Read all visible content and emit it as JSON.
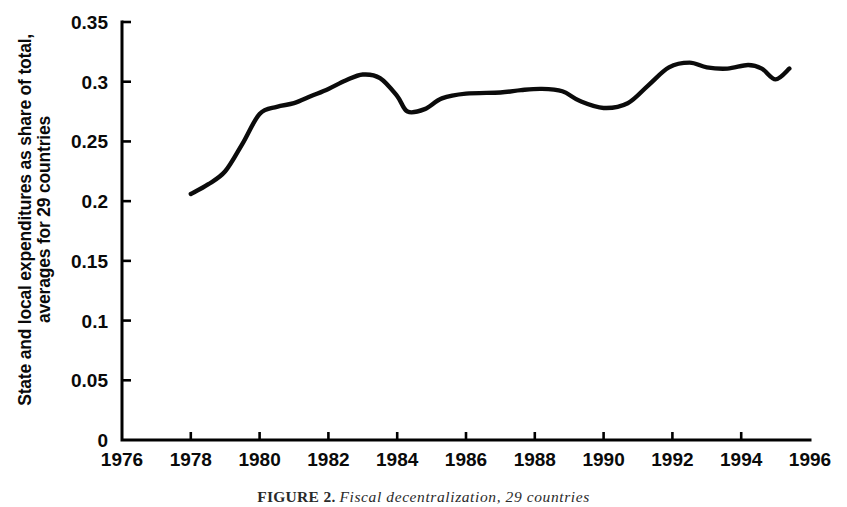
{
  "figure": {
    "caption_label": "FIGURE 2.",
    "caption_text": "Fiscal decentralization, 29 countries"
  },
  "chart_data": {
    "type": "line",
    "title": "",
    "xlabel": "",
    "ylabel": "State and local expenditures as share of total, averages for 29 countries",
    "ylabel_line1": "State and local expenditures as share of total,",
    "ylabel_line2": "averages for 29 countries",
    "xlim": [
      1976,
      1996
    ],
    "ylim": [
      0,
      0.35
    ],
    "xticks": [
      1976,
      1978,
      1980,
      1982,
      1984,
      1986,
      1988,
      1990,
      1992,
      1994,
      1996
    ],
    "xtick_labels": [
      "1976",
      "1978",
      "1980",
      "1982",
      "1984",
      "1986",
      "1988",
      "1990",
      "1992",
      "1994",
      "1996"
    ],
    "yticks": [
      0,
      0.05,
      0.1,
      0.15,
      0.2,
      0.25,
      0.3,
      0.35
    ],
    "ytick_labels": [
      "0",
      "0.05",
      "0.1",
      "0.15",
      "0.2",
      "0.25",
      "0.3",
      "0.35"
    ],
    "grid": false,
    "legend": false,
    "line_color": "#0b0b0b",
    "series": [
      {
        "name": "State and local expenditures as share of total",
        "x": [
          1978.0,
          1978.5,
          1979.0,
          1979.5,
          1980.0,
          1980.5,
          1981.0,
          1981.5,
          1982.0,
          1982.5,
          1983.0,
          1983.5,
          1984.0,
          1984.3,
          1984.8,
          1985.3,
          1986.0,
          1987.0,
          1987.6,
          1988.2,
          1988.8,
          1989.3,
          1990.0,
          1990.7,
          1991.3,
          1991.9,
          1992.5,
          1993.0,
          1993.6,
          1994.2,
          1994.6,
          1995.0,
          1995.4
        ],
        "y": [
          0.206,
          0.214,
          0.225,
          0.248,
          0.273,
          0.279,
          0.282,
          0.288,
          0.294,
          0.301,
          0.306,
          0.303,
          0.288,
          0.275,
          0.277,
          0.286,
          0.29,
          0.291,
          0.293,
          0.294,
          0.292,
          0.284,
          0.278,
          0.282,
          0.297,
          0.312,
          0.316,
          0.312,
          0.311,
          0.314,
          0.311,
          0.302,
          0.311
        ]
      }
    ],
    "annotations": {
      "start_year": 1978,
      "start_value": 0.206,
      "end_year": 1995.4,
      "end_value": 0.32,
      "peak_1983_value": 0.306,
      "trough_1984_value": 0.275,
      "trough_1989_value": 0.278,
      "peak_1992_value": 0.316,
      "trough_1994_value": 0.302,
      "max_value": 0.32,
      "min_value": 0.206
    }
  }
}
